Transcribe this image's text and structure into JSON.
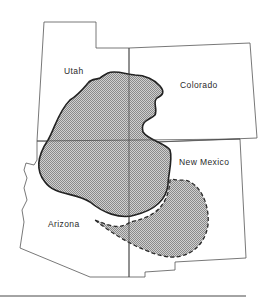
{
  "map": {
    "states": [
      {
        "name": "Utah",
        "label": "Utah"
      },
      {
        "name": "Colorado",
        "label": "Colorado"
      },
      {
        "name": "New Mexico",
        "label": "New Mexico"
      },
      {
        "name": "Arizona",
        "label": "Arizona"
      }
    ],
    "regions": [
      {
        "name": "solid-boundary-region",
        "style": "stippled, solid outline"
      },
      {
        "name": "dashed-boundary-extension",
        "style": "stippled, dashed outline"
      }
    ],
    "colors": {
      "border": "#444444",
      "fill": "#b8b8b8",
      "outline": "#2a2a2a"
    }
  }
}
